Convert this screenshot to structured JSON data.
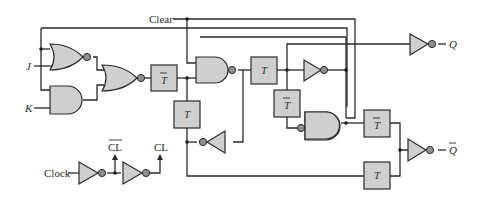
{
  "diagram": {
    "inputs": {
      "clear": "Clear",
      "j": "J",
      "k": "K",
      "clock": "Clock"
    },
    "outputs": {
      "q": "Q",
      "q_bar": "Q"
    },
    "clock_signals": {
      "cl_bar": "CL",
      "cl": "CL"
    },
    "transmission_gates": [
      {
        "id": "tg1",
        "label": "T",
        "inverted": true
      },
      {
        "id": "tg2",
        "label": "T",
        "inverted": false
      },
      {
        "id": "tg3",
        "label": "T",
        "inverted": false
      },
      {
        "id": "tg4",
        "label": "T",
        "inverted": true
      },
      {
        "id": "tg5",
        "label": "T",
        "inverted": true
      },
      {
        "id": "tg6",
        "label": "T",
        "inverted": false
      }
    ],
    "gates": [
      "NOR (J input)",
      "AND (K input)",
      "NOR (combine)",
      "NAND (master)",
      "inverter (master feedback)",
      "inverter (slave)",
      "NAND (slave, inverted input)",
      "output inverter Q",
      "output inverter Q-bar",
      "clock inverter 1",
      "clock inverter 2"
    ],
    "colors": {
      "gate_fill": "#cfcfcf",
      "bubble_fill": "#8f8f8f",
      "wire": "#2a2a2a",
      "background": "#ffffff"
    }
  }
}
